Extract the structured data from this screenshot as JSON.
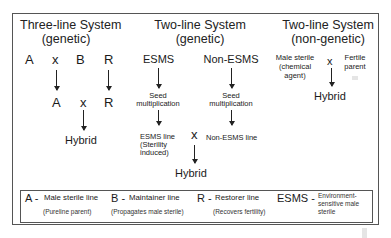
{
  "three_line": {
    "title_line1": "Three-line System",
    "title_line2": "(genetic)",
    "row1": [
      "A",
      "x",
      "B",
      "R"
    ],
    "row2": [
      "A",
      "x",
      "R"
    ],
    "result": "Hybrid"
  },
  "two_line_genetic": {
    "title_line1": "Two-line System",
    "title_line2": "(genetic)",
    "left_parent": "ESMS",
    "right_parent": "Non-ESMS",
    "step_line1": "Seed",
    "step_line2": "multiplication",
    "left_line_1": "ESMS line",
    "left_line_2": "(Sterility",
    "left_line_3": "induced)",
    "right_line": "Non-ESMS line",
    "cross": "x",
    "result": "Hybrid"
  },
  "two_line_nongenetic": {
    "title_line1": "Two-line System",
    "title_line2": "(non-genetic)",
    "left_1": "Male sterile",
    "left_2": "(chemical",
    "left_3": "agent)",
    "cross": "x",
    "right_1": "Fertile",
    "right_2": "parent",
    "result": "Hybrid"
  },
  "legend": {
    "items": [
      {
        "key": "A -",
        "label": "Male sterile line",
        "sub": "(Pureline parent)"
      },
      {
        "key": "B -",
        "label": "Maintainer line",
        "sub": "(Propagates male sterile)"
      },
      {
        "key": "R -",
        "label": "Restorer line",
        "sub": "(Recovers fertility)"
      },
      {
        "key": "ESMS -",
        "label_1": "Environment-",
        "label_2": "sensitive male",
        "label_3": "sterile"
      }
    ]
  }
}
